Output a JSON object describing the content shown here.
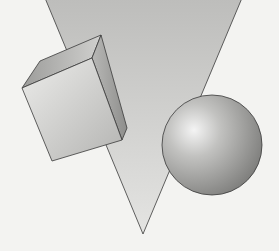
{
  "illustration": {
    "description": "Grayscale geometric shapes illustration",
    "background_color": "#f3f3f1",
    "shapes": [
      {
        "name": "inverted-triangle",
        "fill": "#c4c4c2"
      },
      {
        "name": "cube",
        "fill_front": "#d2d2d0",
        "fill_top": "#a8a8a6",
        "fill_side": "#9a9a98"
      },
      {
        "name": "sphere",
        "highlight": "#f2f2f2",
        "shadow": "#8a8a88"
      }
    ],
    "outline_color": "#3a3a3a"
  }
}
